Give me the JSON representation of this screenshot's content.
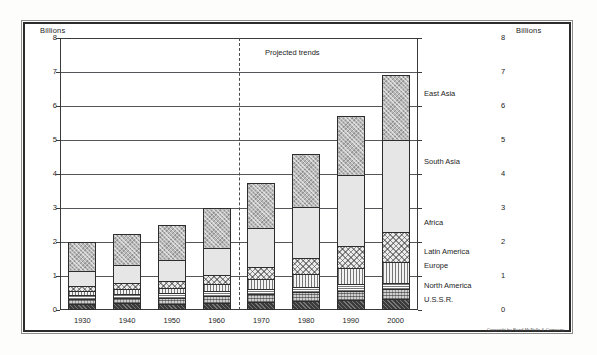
{
  "axis": {
    "unit_label_left": "Billions",
    "unit_label_right": "Billions",
    "yticks": [
      "8",
      "7",
      "6",
      "5",
      "4",
      "3",
      "2",
      "1",
      "0"
    ]
  },
  "annotations": {
    "projected_trends": "Projected trends",
    "copyright": "Copyright by Rand McNally & Company"
  },
  "legend": [
    {
      "label": "East Asia",
      "key": "east_asia"
    },
    {
      "label": "South Asia",
      "key": "south_asia"
    },
    {
      "label": "Africa",
      "key": "africa"
    },
    {
      "label": "Latin America",
      "key": "latin_america"
    },
    {
      "label": "Europe",
      "key": "europe"
    },
    {
      "label": "North America",
      "key": "north_america"
    },
    {
      "label": "U.S.S.R.",
      "key": "ussr"
    }
  ],
  "chart_data": {
    "type": "bar",
    "stacked": true,
    "title": "",
    "subtitle": "",
    "xlabel": "",
    "ylabel": "Billions",
    "ylim": [
      0,
      8
    ],
    "ytick_step": 1,
    "grid": true,
    "legend_position": "right",
    "categories": [
      "1930",
      "1940",
      "1950",
      "1960",
      "1970",
      "1980",
      "1990",
      "2000"
    ],
    "projection_divider_after": "1960",
    "projected_categories": [
      "1970",
      "1980",
      "1990",
      "2000"
    ],
    "series": [
      {
        "name": "U.S.S.R.",
        "values": [
          0.18,
          0.2,
          0.18,
          0.21,
          0.24,
          0.27,
          0.29,
          0.31
        ]
      },
      {
        "name": "North America",
        "values": [
          0.14,
          0.15,
          0.17,
          0.2,
          0.23,
          0.25,
          0.28,
          0.3
        ]
      },
      {
        "name": "Europe",
        "values": [
          0.12,
          0.13,
          0.14,
          0.15,
          0.16,
          0.17,
          0.18,
          0.19
        ]
      },
      {
        "name": "Latin America",
        "values": [
          0.11,
          0.13,
          0.16,
          0.21,
          0.28,
          0.36,
          0.48,
          0.62
        ]
      },
      {
        "name": "Africa",
        "values": [
          0.16,
          0.18,
          0.21,
          0.26,
          0.35,
          0.47,
          0.65,
          0.87
        ]
      },
      {
        "name": "South Asia",
        "values": [
          0.44,
          0.52,
          0.62,
          0.8,
          1.15,
          1.52,
          2.1,
          2.7
        ]
      },
      {
        "name": "East Asia",
        "values": [
          0.85,
          0.94,
          1.02,
          1.17,
          1.34,
          1.56,
          1.72,
          1.91
        ]
      }
    ],
    "totals": [
      2.0,
      2.25,
      2.5,
      3.0,
      3.75,
      4.6,
      5.7,
      6.9
    ],
    "bar_totals_label": [
      "2.0",
      "2.25",
      "2.5",
      "3.0",
      "3.75",
      "4.6",
      "5.9",
      "7.6"
    ]
  }
}
